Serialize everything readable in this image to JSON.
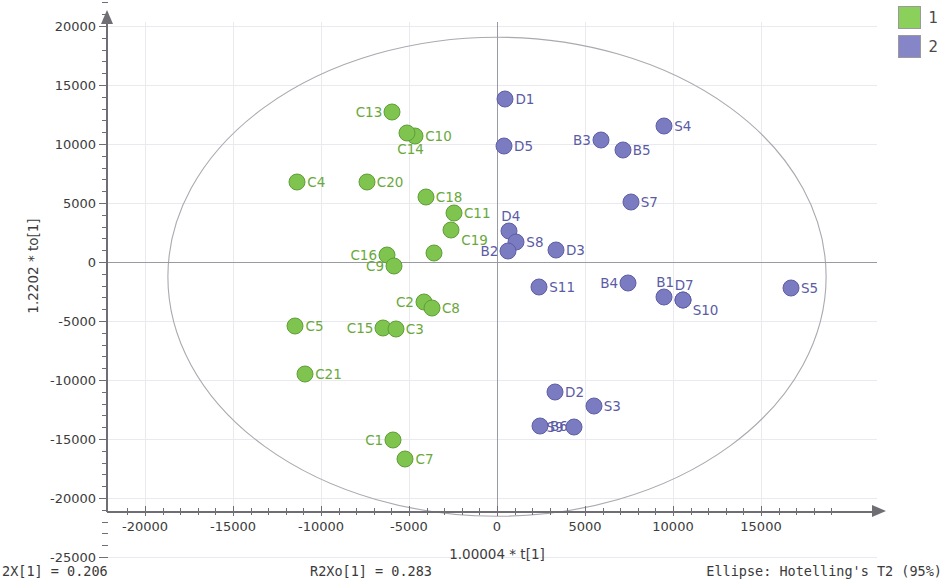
{
  "chart_data": {
    "type": "scatter",
    "title": "",
    "xlabel": "1.00004 * t[1]",
    "ylabel": "1.2202 * to[1]",
    "xlim": [
      -21500,
      19000
    ],
    "ylim": [
      -25500,
      22500
    ],
    "xticks": [
      -20000,
      -15000,
      -10000,
      -5000,
      0,
      5000,
      10000,
      15000
    ],
    "yticks": [
      20000,
      15000,
      10000,
      5000,
      0,
      -5000,
      -10000,
      -15000,
      -20000,
      -25000
    ],
    "xtick_labels": [
      "-20000",
      "-15000",
      "-10000",
      "-5000",
      "0",
      "5000",
      "10000",
      "15000"
    ],
    "ytick_labels": [
      "20000",
      "15000",
      "10000",
      "5000",
      "0",
      "-5000",
      "-10000",
      "-15000",
      "-20000",
      "-25000"
    ],
    "grid": true,
    "legend_position": "top-right",
    "ellipse": {
      "label": "Ellipse: Hotelling's T2 (95%)",
      "center_x": 0,
      "center_y": -1250,
      "semi_axis_x": 18700,
      "semi_axis_y": 20300
    },
    "series": [
      {
        "name": "1",
        "color": "#7fc44f",
        "points": [
          {
            "label": "C13",
            "x": -5950,
            "y": 12700,
            "label_side": "left"
          },
          {
            "label": "C10",
            "x": -4650,
            "y": 10700,
            "label_side": "right"
          },
          {
            "label": "C14",
            "x": -5100,
            "y": 10900,
            "label_side": "below"
          },
          {
            "label": "C4",
            "x": -11350,
            "y": 6800,
            "label_side": "right"
          },
          {
            "label": "C20",
            "x": -7400,
            "y": 6750,
            "label_side": "right"
          },
          {
            "label": "C18",
            "x": -4050,
            "y": 5550,
            "label_side": "right"
          },
          {
            "label": "C11",
            "x": -2450,
            "y": 4150,
            "label_side": "right"
          },
          {
            "label": "C19",
            "x": -2600,
            "y": 2700,
            "label_side": "rightbelow"
          },
          {
            "label": "C16",
            "x": -6250,
            "y": 600,
            "label_side": "left"
          },
          {
            "label": "C9",
            "x": -5850,
            "y": -350,
            "label_side": "left"
          },
          {
            "label": "C9b",
            "x": -3600,
            "y": 800,
            "label_side": "none"
          },
          {
            "label": "C2",
            "x": -4150,
            "y": -3350,
            "label_side": "left"
          },
          {
            "label": "C8",
            "x": -3700,
            "y": -3900,
            "label_side": "right"
          },
          {
            "label": "C5",
            "x": -11450,
            "y": -5400,
            "label_side": "right"
          },
          {
            "label": "C15",
            "x": -6450,
            "y": -5600,
            "label_side": "left"
          },
          {
            "label": "C3",
            "x": -5750,
            "y": -5650,
            "label_side": "right"
          },
          {
            "label": "C21",
            "x": -10900,
            "y": -9500,
            "label_side": "right"
          },
          {
            "label": "C1",
            "x": -5900,
            "y": -15050,
            "label_side": "left"
          },
          {
            "label": "C7",
            "x": -5200,
            "y": -16700,
            "label_side": "right"
          }
        ]
      },
      {
        "name": "2",
        "color": "#7b7bc2",
        "points": [
          {
            "label": "D1",
            "x": 480,
            "y": 13850,
            "label_side": "right"
          },
          {
            "label": "S4",
            "x": 9500,
            "y": 11550,
            "label_side": "right"
          },
          {
            "label": "B3",
            "x": 5900,
            "y": 10350,
            "label_side": "left"
          },
          {
            "label": "B5",
            "x": 7150,
            "y": 9450,
            "label_side": "right"
          },
          {
            "label": "D5",
            "x": 400,
            "y": 9800,
            "label_side": "right"
          },
          {
            "label": "S7",
            "x": 7600,
            "y": 5100,
            "label_side": "right"
          },
          {
            "label": "D4",
            "x": 700,
            "y": 2600,
            "label_side": "above"
          },
          {
            "label": "S8",
            "x": 1100,
            "y": 1700,
            "label_side": "right"
          },
          {
            "label": "B2",
            "x": 650,
            "y": 950,
            "label_side": "left"
          },
          {
            "label": "D3",
            "x": 3350,
            "y": 1050,
            "label_side": "right"
          },
          {
            "label": "S11",
            "x": 2400,
            "y": -2100,
            "label_side": "right"
          },
          {
            "label": "B4",
            "x": 7450,
            "y": -1800,
            "label_side": "left"
          },
          {
            "label": "B1",
            "x": 9500,
            "y": -2950,
            "label_side": "above"
          },
          {
            "label": "D7",
            "x": 10550,
            "y": -3200,
            "label_side": "above"
          },
          {
            "label": "S10",
            "x": 10550,
            "y": -3200,
            "label_side": "rightbelow"
          },
          {
            "label": "S5",
            "x": 16700,
            "y": -2200,
            "label_side": "right"
          },
          {
            "label": "D2",
            "x": 3300,
            "y": -11000,
            "label_side": "right"
          },
          {
            "label": "S3",
            "x": 5500,
            "y": -12200,
            "label_side": "right"
          },
          {
            "label": "B6",
            "x": 2450,
            "y": -13900,
            "label_side": "right"
          },
          {
            "label": "S9",
            "x": 4350,
            "y": -13950,
            "label_side": "left"
          }
        ]
      }
    ]
  },
  "legend": {
    "items": [
      {
        "label": "1",
        "color": "#8cd05c"
      },
      {
        "label": "2",
        "color": "#8585c8"
      }
    ]
  },
  "footer": {
    "left": "2X[1] = 0.206",
    "middle": "R2Xo[1] = 0.283",
    "right": "Ellipse: Hotelling's T2 (95%)"
  }
}
